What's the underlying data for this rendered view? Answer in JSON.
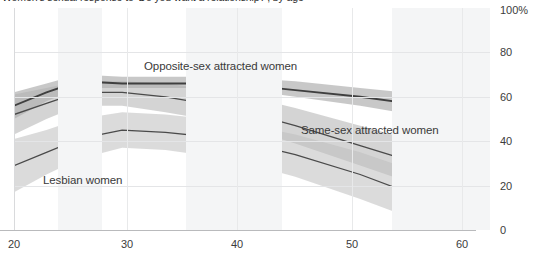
{
  "title": "Women's sexual response to 'Do you want a relationship?', by age",
  "axes": {
    "y_label_top": "100%",
    "y_ticks": [
      "100%",
      "80",
      "60",
      "40",
      "20",
      "0"
    ],
    "y_values": [
      100,
      80,
      60,
      40,
      20,
      0
    ],
    "x_ticks": [
      "20",
      "30",
      "40",
      "50",
      "60"
    ],
    "x_values": [
      20,
      30,
      40,
      50,
      60
    ]
  },
  "series_labels": {
    "opposite": "Opposite-sex attracted women",
    "samesex": "Same-sex attracted women",
    "lesbian": "Lesbian women"
  },
  "chart_data": {
    "type": "line",
    "title": "Women's sexual response to 'Do you want a relationship?', by age",
    "xlabel": "",
    "ylabel": "",
    "xlim": [
      20,
      64
    ],
    "ylim": [
      0,
      100
    ],
    "grid": true,
    "legend": "inline-annotations",
    "y_tick_labels": [
      "0",
      "20",
      "40",
      "60",
      "80",
      "100%"
    ],
    "x_tick_labels": [
      "20",
      "30",
      "40",
      "50",
      "60"
    ],
    "x": [
      20,
      23,
      26,
      30,
      34,
      40,
      46,
      52,
      58,
      64
    ],
    "series": [
      {
        "name": "Opposite-sex attracted women",
        "color": "#3f3f3f",
        "band_color": "#9a9a9a",
        "values": [
          56,
          62,
          67,
          66,
          66,
          66,
          63,
          60,
          56,
          52
        ],
        "band_low": [
          50,
          58,
          64,
          64,
          64,
          64,
          60,
          56,
          51,
          46
        ],
        "band_high": [
          62,
          66,
          70,
          69,
          69,
          69,
          67,
          64,
          61,
          58
        ]
      },
      {
        "name": "Same-sex attracted women",
        "color": "#4a4a4a",
        "band_color": "#b0b0b0",
        "values": [
          52,
          57,
          62,
          62,
          60,
          55,
          47,
          38,
          29,
          20
        ],
        "band_low": [
          43,
          50,
          56,
          56,
          53,
          48,
          39,
          29,
          19,
          10
        ],
        "band_high": [
          61,
          64,
          67,
          67,
          66,
          62,
          55,
          47,
          39,
          31
        ]
      },
      {
        "name": "Lesbian women",
        "color": "#4a4a4a",
        "band_color": "#bdbdbd",
        "values": [
          29,
          35,
          41,
          45,
          44,
          41,
          34,
          25,
          14,
          2
        ],
        "band_low": [
          17,
          25,
          32,
          37,
          36,
          32,
          24,
          14,
          3,
          0
        ],
        "band_high": [
          41,
          45,
          50,
          53,
          52,
          49,
          43,
          35,
          25,
          14
        ]
      }
    ],
    "background_bands": [
      {
        "x_start": 25,
        "x_end": 29
      },
      {
        "x_start": 36,
        "x_end": 45
      },
      {
        "x_start": 55,
        "x_end": 64
      }
    ]
  }
}
